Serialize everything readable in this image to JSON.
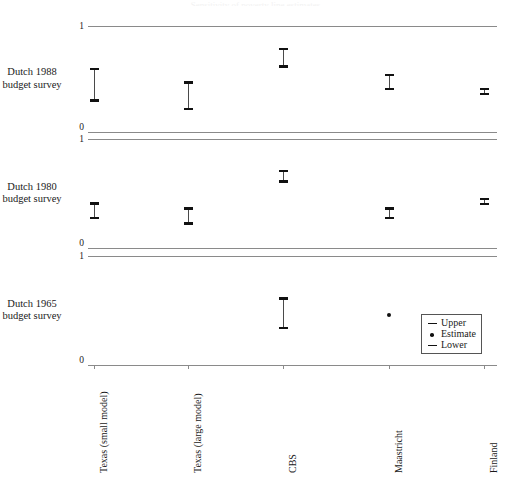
{
  "figure": {
    "cropped_title_fragment": "Sensitivity of poverty line estimates",
    "row_labels": [
      "Dutch 1988\nbudget survey",
      "Dutch 1980\nbudget survey",
      "Dutch 1965\nbudget survey"
    ],
    "y_tick_labels": [
      "1",
      "0"
    ]
  },
  "legend": {
    "position": "bottom-right",
    "entries": [
      {
        "key": "dash",
        "label": "Upper"
      },
      {
        "key": "dot",
        "label": "Estimate"
      },
      {
        "key": "dash",
        "label": "Lower"
      }
    ]
  },
  "colors": {
    "axis": "#8a8a8a",
    "cap": "#111111",
    "stem": "#4a4a4a",
    "text": "#1a1a1a"
  },
  "chart_data": {
    "type": "scatter",
    "title": "",
    "xlabel": "",
    "ylabel": "",
    "ylim": [
      0,
      1
    ],
    "grid": false,
    "legend_position": "bottom-right",
    "categories": [
      "Texas (small model)",
      "Texas (large model)",
      "CBS",
      "Maastricht",
      "Finland"
    ],
    "panels": [
      {
        "name": "Dutch 1988 budget survey",
        "label": "Dutch 1988\nbudget survey",
        "y_top_label": "1",
        "y_bottom_label": "0",
        "series": [
          {
            "name": "Texas (small model)",
            "lower": 0.285,
            "upper": 0.605,
            "estimate": 0.445
          },
          {
            "name": "Texas (large model)",
            "lower": 0.205,
            "upper": 0.48,
            "estimate": 0.343
          },
          {
            "name": "CBS",
            "lower": 0.605,
            "upper": 0.795,
            "estimate": 0.7
          },
          {
            "name": "Maastricht",
            "lower": 0.395,
            "upper": 0.55,
            "estimate": 0.473
          },
          {
            "name": "Finland",
            "lower": 0.345,
            "upper": 0.415,
            "estimate": 0.38
          }
        ]
      },
      {
        "name": "Dutch 1980 budget survey",
        "label": "Dutch 1980\nbudget survey",
        "y_top_label": "1",
        "y_bottom_label": "0",
        "series": [
          {
            "name": "Texas (small model)",
            "lower": 0.265,
            "upper": 0.42,
            "estimate": 0.343
          },
          {
            "name": "Texas (large model)",
            "lower": 0.215,
            "upper": 0.375,
            "estimate": 0.295
          },
          {
            "name": "CBS",
            "lower": 0.6,
            "upper": 0.715,
            "estimate": 0.658
          },
          {
            "name": "Maastricht",
            "lower": 0.265,
            "upper": 0.375,
            "estimate": 0.32
          },
          {
            "name": "Finland",
            "lower": 0.395,
            "upper": 0.46,
            "estimate": 0.428
          }
        ]
      },
      {
        "name": "Dutch 1965 budget survey",
        "label": "Dutch 1965\nbudget survey",
        "y_top_label": "1",
        "y_bottom_label": "0",
        "series": [
          {
            "name": "Texas (small model)",
            "lower": null,
            "upper": null,
            "estimate": null
          },
          {
            "name": "Texas (large model)",
            "lower": null,
            "upper": null,
            "estimate": null
          },
          {
            "name": "CBS",
            "lower": 0.33,
            "upper": 0.62,
            "estimate": 0.475
          },
          {
            "name": "Maastricht",
            "lower": null,
            "upper": null,
            "estimate": 0.46
          },
          {
            "name": "Finland",
            "lower": null,
            "upper": null,
            "estimate": null
          }
        ]
      }
    ]
  }
}
